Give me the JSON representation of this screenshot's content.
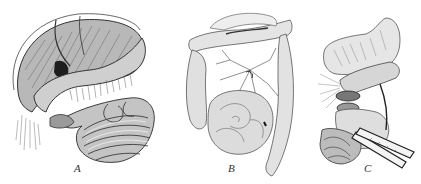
{
  "figure": {
    "panels": [
      {
        "label": "A",
        "subject": "stomach-and-small-intestine-view"
      },
      {
        "label": "B",
        "subject": "colon-and-mesentery-view"
      },
      {
        "label": "C",
        "subject": "stomach-with-clamps-view"
      }
    ],
    "colors": {
      "background": "#ffffff",
      "ink": "#2a2a2a",
      "shade": "#6b6b6b",
      "light_ink": "#9a9a9a"
    }
  }
}
